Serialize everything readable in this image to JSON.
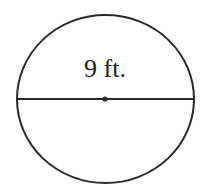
{
  "diagram": {
    "type": "circle-with-diameter",
    "diameter_label": "9 ft.",
    "colors": {
      "stroke": "#2a2a2a",
      "background": "#ffffff",
      "text": "#222222"
    }
  }
}
